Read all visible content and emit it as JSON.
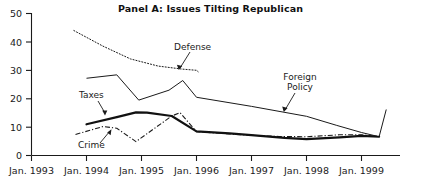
{
  "figure": {
    "title": "Panel A: Issues Tilting Republican",
    "background_color": "#ffffff",
    "ink_color": "#1a1a1a"
  },
  "axes": {
    "y_ticks": [
      "50",
      "40",
      "30",
      "20",
      "10",
      "0"
    ],
    "x_ticks": [
      "Jan. 1993",
      "Jan. 1994",
      "Jan. 1995",
      "Jan. 1996",
      "Jan. 1997",
      "Jan. 1998",
      "Jan. 1999"
    ]
  },
  "annotations": {
    "taxes": "Taxes",
    "crime": "Crime",
    "defense": "Defense",
    "foreign_policy_line1": "Foreign",
    "foreign_policy_line2": "Policy"
  },
  "chart_data": {
    "type": "line",
    "title": "Panel A: Issues Tilting Republican",
    "xlabel": "",
    "ylabel": "",
    "ylim": [
      0,
      50
    ],
    "yticks": [
      0,
      10,
      20,
      30,
      40,
      50
    ],
    "xlim": [
      "Jan. 1993",
      "Jan. 1999"
    ],
    "xticks": [
      "Jan. 1993",
      "Jan. 1994",
      "Jan. 1995",
      "Jan. 1996",
      "Jan. 1997",
      "Jan. 1998",
      "Jan. 1999"
    ],
    "grid": false,
    "legend": "inline annotations with leader arrows",
    "x_unit": "year (fractional, 1993.0 = Jan. 1993)",
    "series": [
      {
        "name": "Defense",
        "style": "dotted",
        "color": "#1a1a1a",
        "width": 1.0,
        "points": [
          {
            "x": 1993.77,
            "y": 44.0
          },
          {
            "x": 1994.3,
            "y": 38.5
          },
          {
            "x": 1994.8,
            "y": 34.0
          },
          {
            "x": 1995.3,
            "y": 31.5
          },
          {
            "x": 1995.75,
            "y": 30.4
          },
          {
            "x": 1996.0,
            "y": 30.0
          },
          {
            "x": 1996.03,
            "y": 29.5
          }
        ]
      },
      {
        "name": "Foreign Policy",
        "style": "solid-thin",
        "color": "#1a1a1a",
        "width": 1.0,
        "points": [
          {
            "x": 1994.0,
            "y": 27.2
          },
          {
            "x": 1994.55,
            "y": 28.4
          },
          {
            "x": 1994.95,
            "y": 19.5
          },
          {
            "x": 1995.5,
            "y": 23.0
          },
          {
            "x": 1995.75,
            "y": 26.4
          },
          {
            "x": 1996.0,
            "y": 20.5
          },
          {
            "x": 1997.0,
            "y": 17.3
          },
          {
            "x": 1998.0,
            "y": 13.8
          },
          {
            "x": 1998.55,
            "y": 10.6
          },
          {
            "x": 1999.0,
            "y": 8.1
          },
          {
            "x": 1999.28,
            "y": 6.8
          }
        ]
      },
      {
        "name": "Taxes",
        "style": "solid-thick",
        "color": "#111111",
        "width": 2.2,
        "points": [
          {
            "x": 1994.0,
            "y": 11.0
          },
          {
            "x": 1994.55,
            "y": 13.5
          },
          {
            "x": 1994.9,
            "y": 15.2
          },
          {
            "x": 1995.1,
            "y": 15.1
          },
          {
            "x": 1995.55,
            "y": 13.9
          },
          {
            "x": 1996.0,
            "y": 8.5
          },
          {
            "x": 1996.6,
            "y": 7.8
          },
          {
            "x": 1997.0,
            "y": 7.2
          },
          {
            "x": 1997.6,
            "y": 6.2
          },
          {
            "x": 1998.0,
            "y": 5.8
          },
          {
            "x": 1998.6,
            "y": 6.4
          },
          {
            "x": 1999.0,
            "y": 6.9
          },
          {
            "x": 1999.32,
            "y": 6.6
          }
        ]
      },
      {
        "name": "Crime",
        "style": "dash-dot",
        "color": "#1a1a1a",
        "width": 1.1,
        "points": [
          {
            "x": 1993.8,
            "y": 7.4
          },
          {
            "x": 1994.3,
            "y": 10.2
          },
          {
            "x": 1994.55,
            "y": 9.6
          },
          {
            "x": 1994.9,
            "y": 4.9
          },
          {
            "x": 1995.55,
            "y": 13.9
          },
          {
            "x": 1995.7,
            "y": 15.1
          },
          {
            "x": 1996.0,
            "y": 8.4
          },
          {
            "x": 1996.6,
            "y": 7.6
          },
          {
            "x": 1997.0,
            "y": 7.1
          },
          {
            "x": 1997.5,
            "y": 6.7
          },
          {
            "x": 1998.0,
            "y": 6.6
          },
          {
            "x": 1998.6,
            "y": 7.3
          },
          {
            "x": 1999.0,
            "y": 7.3
          },
          {
            "x": 1999.3,
            "y": 6.7
          }
        ]
      },
      {
        "name": "Right-edge spike",
        "style": "solid-thin",
        "color": "#1a1a1a",
        "width": 1.0,
        "points": [
          {
            "x": 1999.32,
            "y": 6.6
          },
          {
            "x": 1999.45,
            "y": 16.2
          }
        ]
      }
    ]
  }
}
